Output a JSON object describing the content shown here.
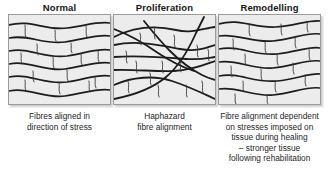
{
  "figure": {
    "background_color": "#ffffff",
    "panel_fill_color": "#ececec",
    "panel_border_color": "#9a9a9a",
    "fibre_color": "#1c1c1c",
    "crack_color": "#3a3a3a"
  },
  "panels": [
    {
      "id": "normal",
      "title": "Normal",
      "caption_lines": [
        "Fibres aligned in",
        "direction of stress"
      ],
      "illustration": "wavy-parallel-fibres",
      "left": 8,
      "box_top": 19,
      "box_width": 103,
      "box_height": 91
    },
    {
      "id": "proliferation",
      "title": "Proliferation",
      "caption_lines": [
        "Haphazard",
        "fibre alignment"
      ],
      "illustration": "crossing-haphazard-fibres",
      "left": 113,
      "box_top": 19,
      "box_width": 103,
      "box_height": 91
    },
    {
      "id": "remodelling",
      "title": "Remodelling",
      "caption_lines": [
        "Fibre alignment dependent",
        "on stresses imposed on",
        "tissue during healing",
        "– stronger tissue",
        "following rehabilitation"
      ],
      "illustration": "realigned-wavy-fibres",
      "left": 218,
      "box_top": 19,
      "box_width": 103,
      "box_height": 91
    }
  ]
}
